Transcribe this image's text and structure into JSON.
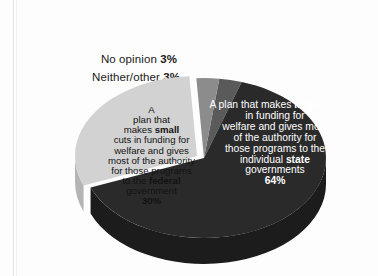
{
  "chart_data": {
    "type": "pie",
    "title": "",
    "subtitle": "",
    "xlabel": "",
    "ylabel": "",
    "legend_position": "none",
    "grid": false,
    "three_d": true,
    "categories": [
      "A plan that makes large cuts in funding for welfare and gives most of the authority for those programs to the individual state governments",
      "A plan that makes small cuts in funding for welfare and gives most of the authority for those programs to the federal government",
      "Neither/other",
      "No opinion"
    ],
    "values": [
      64,
      30,
      3,
      3
    ],
    "labels": [
      "64%",
      "30%",
      "3%",
      "3%"
    ],
    "colors": [
      "#2a2a2a",
      "#d2d2d2",
      "#8c8c8c",
      "#5a5a5a"
    ],
    "slices": [
      {
        "name": "large-cuts-state",
        "value": 64,
        "label": "64%",
        "color": "#2a2a2a",
        "text_color": "#ffffff",
        "label_placement": "inside"
      },
      {
        "name": "small-cuts-federal",
        "value": 30,
        "label": "30%",
        "color": "#d2d2d2",
        "text_color": "#121212",
        "label_placement": "inside",
        "exploded": true
      },
      {
        "name": "neither-other",
        "value": 3,
        "label": "3%",
        "color": "#8c8c8c",
        "text_color": "#1a1a1a",
        "label_placement": "outside"
      },
      {
        "name": "no-opinion",
        "value": 3,
        "label": "3%",
        "color": "#5a5a5a",
        "text_color": "#1a1a1a",
        "label_placement": "outside"
      }
    ]
  },
  "callouts": {
    "no_opinion": {
      "text": "No opinion ",
      "value": "3%"
    },
    "neither_other": {
      "text": "Neither/other ",
      "value": "3%"
    }
  },
  "slice_labels": {
    "large": {
      "line1": "A plan that makes ",
      "bold1": "large",
      "line2": " cuts in funding for\nwelfare and gives most\nof the authority for\nthose programs to the\nindividual ",
      "bold2": "state",
      "line3": "\ngovernments\n",
      "value": "64%"
    },
    "small": {
      "line1": "A\nplan that\nmakes ",
      "bold1": "small",
      "line2": "\ncuts in funding for\nwelfare and gives\nmost of the authority\nfor those programs\nto the ",
      "bold2": "federal",
      "line3": "\ngovernment\n",
      "value": "30%"
    }
  },
  "colors": {
    "background": "#fdfdfd",
    "dark_slice": "#2a2a2a",
    "dark_slice_side": "#1c1c1c",
    "light_slice": "#d2d2d2",
    "light_slice_side": "#b4b4b4",
    "mid_gray_slice": "#8c8c8c",
    "dark_gray_slice": "#5a5a5a",
    "text_dark": "#1a1a1a",
    "text_light": "#ffffff",
    "scan_rule": "#e2e2e2"
  }
}
